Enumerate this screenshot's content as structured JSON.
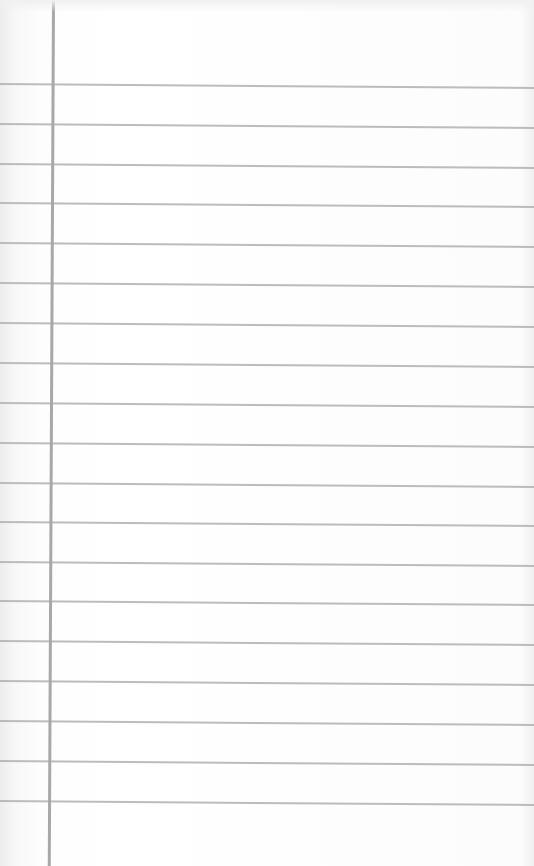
{
  "page": {
    "type": "lined-notepad-paper",
    "text_content": ""
  },
  "colors": {
    "paper": "#fdfdfd",
    "rule_line": "#b0b0b0",
    "margin_line": "#a8a8a8"
  },
  "layout": {
    "margin_line_x": 53,
    "rule_lines_y": [
      84,
      124,
      164,
      203,
      243,
      283,
      323,
      363,
      403,
      443,
      483,
      522,
      562,
      601,
      641,
      681,
      721,
      761,
      801
    ]
  }
}
